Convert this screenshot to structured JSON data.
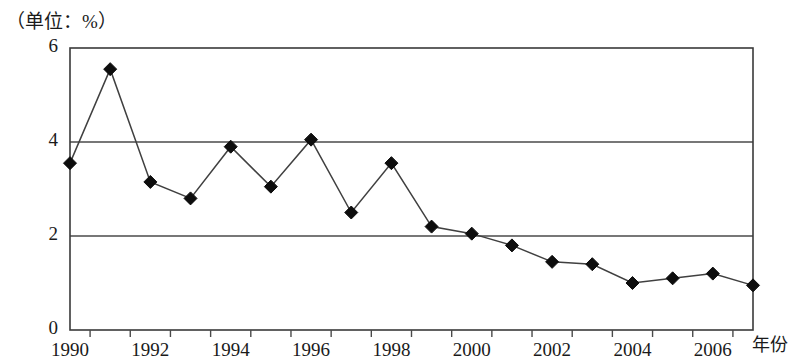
{
  "unit_label": "（单位：%）",
  "axis_caption_x": "年份",
  "chart_data": {
    "type": "line",
    "title": "",
    "subtitle": "",
    "xlabel": "年份",
    "ylabel": "（单位：%）",
    "unit": "%",
    "x": [
      1990,
      1991,
      1992,
      1993,
      1994,
      1995,
      1996,
      1997,
      1998,
      1999,
      2000,
      2001,
      2002,
      2003,
      2004,
      2005,
      2006,
      2007
    ],
    "categories": [
      "1990",
      "1991",
      "1992",
      "1993",
      "1994",
      "1995",
      "1996",
      "1997",
      "1998",
      "1999",
      "2000",
      "2001",
      "2002",
      "2003",
      "2004",
      "2005",
      "2006",
      "2007"
    ],
    "values": [
      3.55,
      5.55,
      3.15,
      2.8,
      3.9,
      3.05,
      4.05,
      2.5,
      3.55,
      2.2,
      2.05,
      1.8,
      1.45,
      1.4,
      1.0,
      1.1,
      1.2,
      0.95
    ],
    "series": [
      {
        "name": "",
        "values": [
          3.55,
          5.55,
          3.15,
          2.8,
          3.9,
          3.05,
          4.05,
          2.5,
          3.55,
          2.2,
          2.05,
          1.8,
          1.45,
          1.4,
          1.0,
          1.1,
          1.2,
          0.95
        ],
        "marker": "diamond",
        "color": "#0d0d0d"
      }
    ],
    "ylim": [
      0,
      6
    ],
    "xlim": [
      1990,
      2007
    ],
    "ytick_labels": [
      "0",
      "2",
      "4",
      "6"
    ],
    "ytick_values": [
      0,
      2,
      4,
      6
    ],
    "xtick_labels": [
      "1990",
      "1992",
      "1994",
      "1996",
      "1998",
      "2000",
      "2002",
      "2004",
      "2006"
    ],
    "xtick_values": [
      1990,
      1992,
      1994,
      1996,
      1998,
      2000,
      2002,
      2004,
      2006
    ],
    "grid": "horizontal",
    "gridline_values": [
      2,
      4
    ],
    "legend": "none",
    "legend_position": "none",
    "annotations": []
  }
}
